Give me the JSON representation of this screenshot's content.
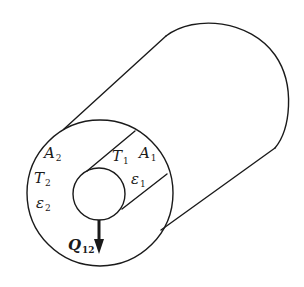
{
  "diagram": {
    "type": "coaxial-cylinder-radiation",
    "colors": {
      "stroke": "#1a1a1a",
      "background": "#ffffff"
    },
    "labels": {
      "outer_area": {
        "symbol": "A",
        "sub": "2"
      },
      "outer_temp": {
        "symbol": "T",
        "sub": "2"
      },
      "outer_emissivity": {
        "symbol": "ε",
        "sub": "2"
      },
      "inner_temp": {
        "symbol": "T",
        "sub": "1"
      },
      "inner_area": {
        "symbol": "A",
        "sub": "1"
      },
      "inner_emissivity": {
        "symbol": "ε",
        "sub": "1"
      },
      "heat_flow": {
        "symbol": "Q",
        "sub": "12"
      }
    },
    "shapes": {
      "outer_front_circle": {
        "cx": 100,
        "cy": 193,
        "r": 73
      },
      "inner_front_circle": {
        "cx": 99,
        "cy": 194,
        "r": 26
      },
      "arrow": {
        "direction": "down"
      }
    }
  }
}
